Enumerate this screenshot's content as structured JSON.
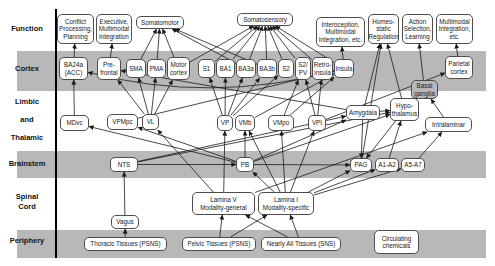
{
  "colors": {
    "band": "#b8b8b8",
    "box_fill": "#ffffff",
    "box_border": "#4d4d4d",
    "line": "#1a1a1a",
    "text": "#1a1a1a"
  },
  "diagram": {
    "axis": {
      "x": 55,
      "y1": 9,
      "y2": 258
    },
    "bands": [
      {
        "y": 51,
        "h": 40
      },
      {
        "y": 151,
        "h": 27
      },
      {
        "y": 230,
        "h": 28
      }
    ],
    "band_x": 17,
    "band_w": 469,
    "row_labels": [
      {
        "text": "Function",
        "x": 2,
        "y": 24,
        "w": 50
      },
      {
        "text": "Cortex",
        "x": 2,
        "y": 64,
        "w": 50
      },
      {
        "text": "Limbic",
        "x": 2,
        "y": 97,
        "w": 50
      },
      {
        "text": "and",
        "x": 2,
        "y": 115,
        "w": 50
      },
      {
        "text": "Thalamic",
        "x": 2,
        "y": 133,
        "w": 50
      },
      {
        "text": "Brainstem",
        "x": 2,
        "y": 159,
        "w": 50
      },
      {
        "text": "Spinal",
        "x": 2,
        "y": 192,
        "w": 50
      },
      {
        "text": "Cord",
        "x": 2,
        "y": 202,
        "w": 50
      },
      {
        "text": "Periphery",
        "x": 2,
        "y": 236,
        "w": 50
      }
    ],
    "nodes": [
      {
        "id": "conflict",
        "label": "Conflict\nProcessing,\nPlanning",
        "x": 57,
        "y": 14,
        "w": 37,
        "h": 30
      },
      {
        "id": "executive",
        "label": "Executive,\nMultimodal\nIntegration",
        "x": 96,
        "y": 14,
        "w": 36,
        "h": 30
      },
      {
        "id": "somatomotor",
        "label": "Somatomotor",
        "x": 136,
        "y": 16,
        "w": 48,
        "h": 13
      },
      {
        "id": "somatosensory",
        "label": "Somatosensory",
        "x": 237,
        "y": 13,
        "w": 56,
        "h": 13
      },
      {
        "id": "interoception",
        "label": "Interoception,\nMultimodal\nIntegration, etc.",
        "x": 316,
        "y": 17,
        "w": 49,
        "h": 30
      },
      {
        "id": "homeostatic",
        "label": "Homeo-\nstatic\nRegulation",
        "x": 368,
        "y": 14,
        "w": 31,
        "h": 30
      },
      {
        "id": "action",
        "label": "Action\nSelection,\nLearning",
        "x": 402,
        "y": 14,
        "w": 31,
        "h": 30
      },
      {
        "id": "multimodal",
        "label": "Multimodal\nIntegration,\netc.",
        "x": 436,
        "y": 14,
        "w": 37,
        "h": 30
      },
      {
        "id": "ba24a",
        "label": "BA24a\n(ACC)",
        "x": 59,
        "y": 57,
        "w": 29,
        "h": 23
      },
      {
        "id": "prefrontal",
        "label": "Pre-\nfrontal",
        "x": 97,
        "y": 57,
        "w": 24,
        "h": 23
      },
      {
        "id": "sma",
        "label": "SMA",
        "x": 126,
        "y": 59,
        "w": 20,
        "h": 19
      },
      {
        "id": "pma",
        "label": "PMA",
        "x": 147,
        "y": 59,
        "w": 19,
        "h": 19
      },
      {
        "id": "motor",
        "label": "Motor\ncortex",
        "x": 167,
        "y": 57,
        "w": 23,
        "h": 23
      },
      {
        "id": "s1",
        "label": "S1",
        "x": 198,
        "y": 59,
        "w": 17,
        "h": 19
      },
      {
        "id": "ba1",
        "label": "BA1",
        "x": 216,
        "y": 59,
        "w": 19,
        "h": 19
      },
      {
        "id": "ba3a",
        "label": "BA3a",
        "x": 236,
        "y": 59,
        "w": 20,
        "h": 19
      },
      {
        "id": "ba3b",
        "label": "BA3b",
        "x": 257,
        "y": 59,
        "w": 20,
        "h": 19
      },
      {
        "id": "s2",
        "label": "S2",
        "x": 278,
        "y": 59,
        "w": 16,
        "h": 19
      },
      {
        "id": "s2pv",
        "label": "S2/\nPV",
        "x": 295,
        "y": 57,
        "w": 16,
        "h": 23
      },
      {
        "id": "retroinsula",
        "label": "Retro-\ninsula",
        "x": 312,
        "y": 57,
        "w": 21,
        "h": 23
      },
      {
        "id": "insula",
        "label": "Insula",
        "x": 334,
        "y": 59,
        "w": 20,
        "h": 19
      },
      {
        "id": "parietal",
        "label": "Parietal\ncortex",
        "x": 445,
        "y": 56,
        "w": 28,
        "h": 23
      },
      {
        "id": "basal",
        "label": "Basal\nganglia",
        "x": 411,
        "y": 80,
        "w": 27,
        "h": 19,
        "fill": "band"
      },
      {
        "id": "mdvc",
        "label": "MDvc",
        "x": 60,
        "y": 115,
        "w": 29,
        "h": 16
      },
      {
        "id": "vpmpc",
        "label": "VPMpc",
        "x": 107,
        "y": 114,
        "w": 31,
        "h": 16
      },
      {
        "id": "vl",
        "label": "VL",
        "x": 142,
        "y": 114,
        "w": 17,
        "h": 16
      },
      {
        "id": "vp",
        "label": "VP",
        "x": 217,
        "y": 115,
        "w": 16,
        "h": 16
      },
      {
        "id": "vmb",
        "label": "VMb",
        "x": 235,
        "y": 115,
        "w": 20,
        "h": 16
      },
      {
        "id": "vmpo",
        "label": "VMpo",
        "x": 268,
        "y": 115,
        "w": 26,
        "h": 16
      },
      {
        "id": "vpi",
        "label": "VPI",
        "x": 308,
        "y": 115,
        "w": 18,
        "h": 16
      },
      {
        "id": "amygdala",
        "label": "Amygdala",
        "x": 346,
        "y": 105,
        "w": 34,
        "h": 15
      },
      {
        "id": "hypothalamus",
        "label": "Hypo-\nthalamus",
        "x": 390,
        "y": 98,
        "w": 29,
        "h": 23
      },
      {
        "id": "intralaminar",
        "label": "Intralaminar",
        "x": 425,
        "y": 117,
        "w": 47,
        "h": 15
      },
      {
        "id": "nts",
        "label": "NTS",
        "x": 110,
        "y": 157,
        "w": 28,
        "h": 15
      },
      {
        "id": "pb",
        "label": "PB",
        "x": 236,
        "y": 157,
        "w": 18,
        "h": 15
      },
      {
        "id": "pag",
        "label": "PAG",
        "x": 350,
        "y": 158,
        "w": 22,
        "h": 14
      },
      {
        "id": "a1a2",
        "label": "A1-A2",
        "x": 375,
        "y": 158,
        "w": 24,
        "h": 14
      },
      {
        "id": "a5a7",
        "label": "A5-A7",
        "x": 401,
        "y": 158,
        "w": 24,
        "h": 14
      },
      {
        "id": "laminaV",
        "label": "Lamina V\nModality-general",
        "x": 192,
        "y": 192,
        "w": 63,
        "h": 23
      },
      {
        "id": "laminaI",
        "label": "Lamina I\nModality-specific",
        "x": 258,
        "y": 192,
        "w": 56,
        "h": 23
      },
      {
        "id": "vagus",
        "label": "Vagus",
        "x": 111,
        "y": 215,
        "w": 28,
        "h": 14
      },
      {
        "id": "thoracic",
        "label": "Thoracic Tissues (PSNS)",
        "x": 84,
        "y": 237,
        "w": 83,
        "h": 14
      },
      {
        "id": "pelvic",
        "label": "Pelvic Tissues (PSNS)",
        "x": 182,
        "y": 237,
        "w": 74,
        "h": 14
      },
      {
        "id": "nearly",
        "label": "Nearly All Tissues (SNS)",
        "x": 261,
        "y": 237,
        "w": 80,
        "h": 14
      },
      {
        "id": "circulating",
        "label": "Circulating\nchemicals",
        "x": 374,
        "y": 230,
        "w": 45,
        "h": 24
      }
    ],
    "edges": [
      [
        "ba24a",
        "conflict"
      ],
      [
        "prefrontal",
        "executive"
      ],
      [
        "sma",
        "somatomotor"
      ],
      [
        "pma",
        "somatomotor"
      ],
      [
        "motor",
        "somatomotor"
      ],
      [
        "ba3a",
        "somatomotor"
      ],
      [
        "ba3b",
        "somatomotor"
      ],
      [
        "motor",
        "somatosensory"
      ],
      [
        "s1",
        "somatosensory"
      ],
      [
        "ba1",
        "somatosensory"
      ],
      [
        "ba3a",
        "somatosensory"
      ],
      [
        "ba3b",
        "somatosensory"
      ],
      [
        "s2",
        "somatosensory"
      ],
      [
        "s2pv",
        "somatosensory"
      ],
      [
        "retroinsula",
        "somatosensory"
      ],
      [
        "insula",
        "somatosensory"
      ],
      [
        "insula",
        "interoception"
      ],
      [
        "amygdala",
        "homeostatic"
      ],
      [
        "hypothalamus",
        "homeostatic"
      ],
      [
        "pag",
        "homeostatic"
      ],
      [
        "basal",
        "action"
      ],
      [
        "parietal",
        "multimodal"
      ],
      [
        "mdvc",
        "ba24a"
      ],
      [
        "vl",
        "prefrontal"
      ],
      [
        "amygdala",
        "prefrontal"
      ],
      [
        "vl",
        "sma"
      ],
      [
        "vl",
        "pma"
      ],
      [
        "vl",
        "motor"
      ],
      [
        "vp",
        "s1"
      ],
      [
        "vp",
        "ba1"
      ],
      [
        "vp",
        "ba3a"
      ],
      [
        "vp",
        "ba3b"
      ],
      [
        "vp",
        "s2"
      ],
      [
        "vpmpc",
        "insula"
      ],
      [
        "vmb",
        "insula"
      ],
      [
        "vmpo",
        "insula"
      ],
      [
        "vmpo",
        "s2pv"
      ],
      [
        "vpi",
        "s2pv"
      ],
      [
        "vpi",
        "retroinsula"
      ],
      [
        "vpi",
        "parietal"
      ],
      [
        "intralaminar",
        "basal"
      ],
      [
        "insula",
        "ba24a",
        [
          210,
          104
        ]
      ],
      [
        "amygdala",
        "hypothalamus"
      ],
      [
        "nts",
        "pb"
      ],
      [
        "pb",
        "mdvc"
      ],
      [
        "pb",
        "vpmpc"
      ],
      [
        "pb",
        "vmb"
      ],
      [
        "pb",
        "amygdala"
      ],
      [
        "pb",
        "hypothalamus"
      ],
      [
        "nts",
        "amygdala"
      ],
      [
        "nts",
        "hypothalamus"
      ],
      [
        "pb",
        "pag"
      ],
      [
        "a1a2",
        "hypothalamus"
      ],
      [
        "a5a7",
        "intralaminar"
      ],
      [
        "hypothalamus",
        "pag"
      ],
      [
        "amygdala",
        "pag"
      ],
      [
        "laminaV",
        "vp"
      ],
      [
        "laminaV",
        "vl"
      ],
      [
        "laminaV",
        "intralaminar"
      ],
      [
        "laminaI",
        "pb"
      ],
      [
        "laminaI",
        "pag"
      ],
      [
        "laminaI",
        "a1a2"
      ],
      [
        "laminaI",
        "a5a7"
      ],
      [
        "laminaI",
        "vmpo"
      ],
      [
        "laminaI",
        "vpi"
      ],
      [
        "laminaI",
        "vmb"
      ],
      [
        "thoracic",
        "vagus"
      ],
      [
        "vagus",
        "nts"
      ],
      [
        "pelvic",
        "laminaV"
      ],
      [
        "pelvic",
        "laminaI"
      ],
      [
        "nearly",
        "laminaV"
      ],
      [
        "nearly",
        "laminaI"
      ]
    ]
  }
}
